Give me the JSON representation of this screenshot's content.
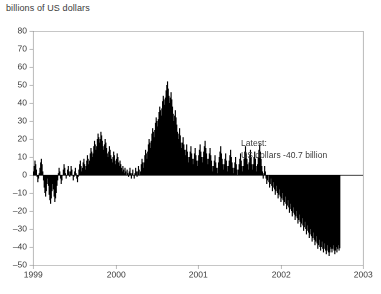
{
  "chart_data": {
    "type": "bar",
    "title": "billions of US dollars",
    "xlabel": "",
    "ylabel": "",
    "ylim": [
      -50,
      80
    ],
    "xlim": [
      1999.0,
      2003.0
    ],
    "ytick_values": [
      -50,
      -40,
      -30,
      -20,
      -10,
      0,
      10,
      20,
      30,
      40,
      50,
      60,
      70,
      80
    ],
    "ytick_labels": [
      "-50",
      "-40",
      "-30",
      "-20",
      "-10",
      "0",
      "10",
      "20",
      "30",
      "40",
      "50",
      "60",
      "70",
      "80"
    ],
    "xtick_values": [
      1999,
      2000,
      2001,
      2002,
      2003
    ],
    "xtick_labels": [
      "1999",
      "2000",
      "2001",
      "2002",
      "2003"
    ],
    "grid": false,
    "legend": "none",
    "bar_color": "#000000",
    "axis_color": "#8c8c8c",
    "text_color": "#3a3a3a",
    "zero_line": 0,
    "series_name": "Net flow",
    "x_start": 1999.0,
    "x_end": 2002.72,
    "values": [
      2,
      5,
      8,
      6,
      3,
      -1,
      -4,
      -2,
      1,
      4,
      7,
      9,
      6,
      2,
      -3,
      -7,
      -10,
      -12,
      -9,
      -5,
      -2,
      -6,
      -11,
      -14,
      -16,
      -13,
      -9,
      -5,
      -8,
      -12,
      -15,
      -13,
      -10,
      -6,
      -3,
      1,
      4,
      2,
      -2,
      -5,
      -3,
      0,
      3,
      6,
      4,
      1,
      -2,
      0,
      3,
      5,
      2,
      -1,
      2,
      5,
      3,
      0,
      -3,
      -1,
      2,
      4,
      1,
      -2,
      -4,
      -1,
      3,
      6,
      8,
      5,
      2,
      4,
      7,
      9,
      6,
      3,
      5,
      8,
      11,
      9,
      6,
      8,
      12,
      15,
      13,
      10,
      12,
      16,
      19,
      17,
      14,
      16,
      20,
      23,
      21,
      18,
      20,
      24,
      22,
      19,
      16,
      14,
      17,
      20,
      18,
      15,
      12,
      10,
      13,
      16,
      14,
      11,
      9,
      7,
      10,
      13,
      11,
      8,
      6,
      9,
      12,
      10,
      7,
      5,
      8,
      6,
      4,
      2,
      5,
      3,
      1,
      4,
      2,
      0,
      3,
      1,
      -1,
      2,
      4,
      1,
      -2,
      1,
      3,
      0,
      -2,
      1,
      4,
      2,
      -1,
      2,
      5,
      3,
      0,
      2,
      6,
      9,
      7,
      4,
      7,
      11,
      14,
      12,
      9,
      13,
      17,
      20,
      18,
      15,
      19,
      23,
      26,
      24,
      21,
      25,
      29,
      32,
      30,
      27,
      31,
      35,
      38,
      36,
      33,
      37,
      41,
      44,
      42,
      39,
      43,
      47,
      50,
      52,
      48,
      44,
      40,
      43,
      46,
      42,
      38,
      34,
      30,
      33,
      36,
      32,
      28,
      24,
      20,
      23,
      26,
      22,
      18,
      15,
      18,
      21,
      17,
      14,
      11,
      14,
      17,
      13,
      10,
      7,
      10,
      13,
      16,
      12,
      9,
      6,
      9,
      12,
      15,
      11,
      8,
      5,
      8,
      11,
      14,
      17,
      13,
      10,
      7,
      10,
      13,
      16,
      19,
      15,
      12,
      9,
      6,
      9,
      12,
      15,
      11,
      8,
      5,
      2,
      5,
      8,
      11,
      7,
      4,
      1,
      4,
      7,
      10,
      13,
      16,
      12,
      9,
      6,
      3,
      6,
      9,
      12,
      8,
      5,
      2,
      5,
      8,
      11,
      14,
      10,
      7,
      4,
      1,
      4,
      7,
      10,
      6,
      3,
      0,
      3,
      6,
      9,
      12,
      8,
      5,
      2,
      5,
      9,
      13,
      16,
      12,
      9,
      6,
      3,
      7,
      11,
      14,
      10,
      6,
      3,
      6,
      10,
      13,
      9,
      5,
      2,
      6,
      10,
      14,
      17,
      13,
      9,
      5,
      2,
      -2,
      1,
      5,
      2,
      -2,
      -5,
      -3,
      0,
      -4,
      -7,
      -5,
      -2,
      -6,
      -9,
      -7,
      -4,
      -8,
      -11,
      -9,
      -6,
      -10,
      -13,
      -11,
      -8,
      -12,
      -15,
      -13,
      -10,
      -14,
      -17,
      -15,
      -12,
      -16,
      -19,
      -17,
      -14,
      -18,
      -21,
      -19,
      -16,
      -20,
      -23,
      -21,
      -18,
      -22,
      -25,
      -23,
      -20,
      -24,
      -27,
      -25,
      -22,
      -26,
      -29,
      -27,
      -24,
      -28,
      -31,
      -29,
      -26,
      -30,
      -33,
      -31,
      -28,
      -32,
      -35,
      -33,
      -30,
      -34,
      -37,
      -35,
      -32,
      -36,
      -39,
      -37,
      -34,
      -38,
      -41,
      -39,
      -36,
      -40,
      -42,
      -40,
      -37,
      -41,
      -43,
      -41,
      -38,
      -42,
      -44,
      -42,
      -39,
      -43,
      -45,
      -43,
      -40,
      -41,
      -43,
      -41,
      -39,
      -42,
      -44,
      -42,
      -40,
      -43,
      -41,
      -39,
      -42,
      -40.7
    ],
    "annotation": {
      "line1": "Latest:",
      "line2": "US dollars -40.7 billion",
      "value": -40.7,
      "unit": "billions of US dollars"
    }
  },
  "plot_geometry": {
    "left": 33,
    "top": 31,
    "right": 363,
    "bottom": 265
  }
}
